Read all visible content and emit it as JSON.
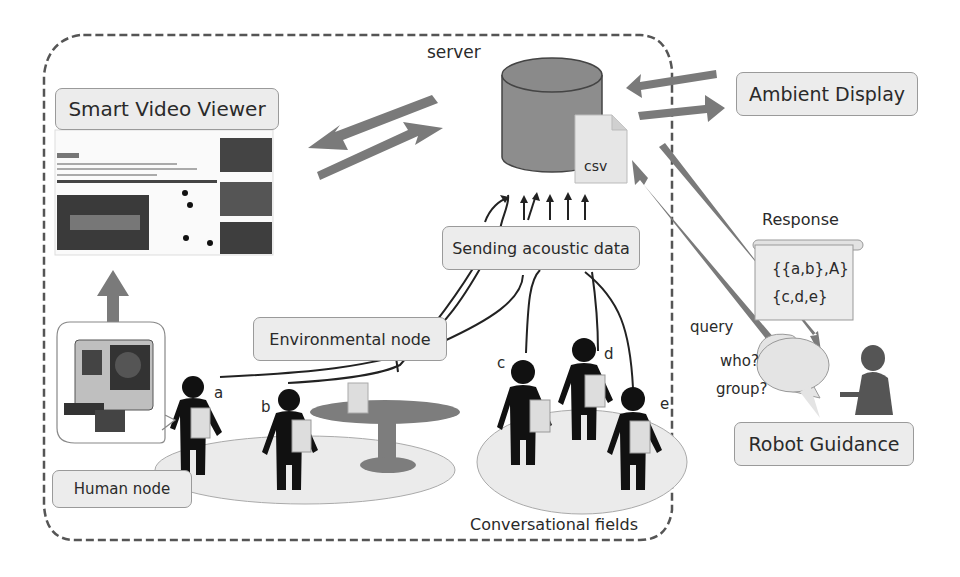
{
  "server": {
    "label": "server",
    "file_label": "csv"
  },
  "boxes": {
    "smart_video_viewer": "Smart Video Viewer",
    "ambient_display": "Ambient Display",
    "sending_acoustic_data": "Sending acoustic data",
    "environmental_node": "Environmental node",
    "human_node": "Human node",
    "robot_guidance": "Robot Guidance"
  },
  "labels": {
    "response": "Response",
    "query": "query",
    "conversational_fields": "Conversational fields"
  },
  "response_scroll": {
    "line1": "{{a,b},A}",
    "line2": "{c,d,e}"
  },
  "speech_bubble": {
    "line1": "who?",
    "line2": "group?"
  },
  "people": [
    "a",
    "b",
    "c",
    "d",
    "e"
  ],
  "colors": {
    "arrow": "#7a7a7a",
    "box_fill": "#ececec",
    "field_fill": "#ebebeb",
    "table": "#7d7d7d",
    "person": "#111111"
  }
}
